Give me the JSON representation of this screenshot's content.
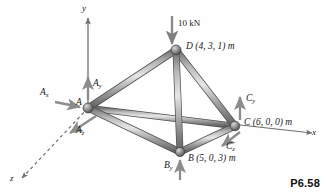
{
  "figure": {
    "caption": "P6.58",
    "background_color": "#fefefe",
    "member_color": "#8a8a8a",
    "joint_color": "#7d7d7d",
    "arrow_color": "#8c8c8c",
    "axis_color": "#6f6f6f"
  },
  "axes": [
    {
      "name": "y-axis",
      "label": "y",
      "direction": "up"
    },
    {
      "name": "x-axis",
      "label": "x",
      "direction": "right"
    },
    {
      "name": "z-axis",
      "label": "z",
      "direction": "down-left",
      "style": "dashed"
    }
  ],
  "nodes": [
    {
      "id": "A",
      "label": "A",
      "coords_text": "",
      "x": 88,
      "y": 108
    },
    {
      "id": "B",
      "label": "B",
      "coords_text": "B (5, 0, 3) m",
      "x": 180,
      "y": 152
    },
    {
      "id": "C",
      "label": "C",
      "coords_text": "C (6, 0, 0) m",
      "x": 235,
      "y": 126
    },
    {
      "id": "D",
      "label": "D",
      "coords_text": "D (4, 3, 1) m",
      "x": 176,
      "y": 50
    }
  ],
  "members": [
    {
      "from": "A",
      "to": "D"
    },
    {
      "from": "A",
      "to": "B"
    },
    {
      "from": "A",
      "to": "C"
    },
    {
      "from": "D",
      "to": "B"
    },
    {
      "from": "D",
      "to": "C"
    },
    {
      "from": "B",
      "to": "C"
    }
  ],
  "load": {
    "name": "applied-load",
    "magnitude": "10",
    "unit": "kN",
    "label": "10 kN",
    "at_node": "D",
    "direction": "down"
  },
  "reactions": [
    {
      "name": "Ax",
      "base": "A",
      "sub": "x",
      "at_node": "A",
      "direction": "right"
    },
    {
      "name": "Ay",
      "base": "A",
      "sub": "y",
      "at_node": "A",
      "direction": "up"
    },
    {
      "name": "Az",
      "base": "A",
      "sub": "z",
      "at_node": "A",
      "direction": "down-left"
    },
    {
      "name": "By",
      "base": "B",
      "sub": "y",
      "at_node": "B",
      "direction": "up"
    },
    {
      "name": "Cy",
      "base": "C",
      "sub": "y",
      "at_node": "C",
      "direction": "up"
    },
    {
      "name": "Cz",
      "base": "C",
      "sub": "z",
      "at_node": "C",
      "direction": "down-left"
    }
  ]
}
